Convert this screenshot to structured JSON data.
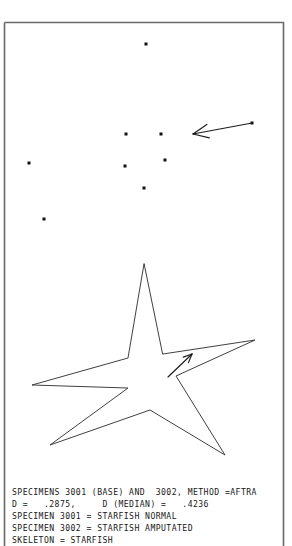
{
  "figure": {
    "background_color": "#ffffff",
    "frame_color": "#6a6a6a",
    "point_color": "#111111",
    "line_color": "#2a2a2a",
    "width": 292,
    "height": 546
  },
  "caption": {
    "line1": "SPECIMENS 3001 (BASE) AND  3002, METHOD =AFTRA",
    "line2": "D =   .2875,     D (MEDIAN) =   .4236",
    "line3": "SPECIMEN 3001 = STARFISH NORMAL",
    "line4": "SPECIMEN 3002 = STARFISH AMPUTATED",
    "line5": "SKELETON = STARFISH"
  },
  "readout": {
    "specimen_base_id": "3001",
    "specimen_target_id": "3002",
    "method": "AFTRA",
    "d_value": ".2875",
    "d_median_value": ".4236",
    "specimen_3001_label": "STARFISH NORMAL",
    "specimen_3002_label": "STARFISH AMPUTATED",
    "skeleton_label": "STARFISH"
  },
  "chart_data": {
    "type": "scatter",
    "title": "SPECIMENS 3001 (BASE) AND  3002, METHOD =AFTRA",
    "xlabel": "",
    "ylabel": "",
    "grid": false,
    "legend": "none",
    "xlim": [
      0,
      292
    ],
    "ylim": [
      546,
      0
    ],
    "series": [
      {
        "name": "landmarks",
        "marker": "square",
        "marker_size": 3,
        "points": [
          {
            "x": 146,
            "y": 44
          },
          {
            "x": 126,
            "y": 134
          },
          {
            "x": 161,
            "y": 134
          },
          {
            "x": 252,
            "y": 123
          },
          {
            "x": 29,
            "y": 163
          },
          {
            "x": 125,
            "y": 166
          },
          {
            "x": 165,
            "y": 160
          },
          {
            "x": 144,
            "y": 188
          },
          {
            "x": 44,
            "y": 219
          }
        ]
      }
    ],
    "vectors": [
      {
        "name": "displacement-arrow-outer",
        "x1": 252,
        "y1": 123,
        "x2": 193,
        "y2": 134,
        "head": "end"
      },
      {
        "name": "displacement-arrow-inner",
        "x1": 168,
        "y1": 377,
        "x2": 192,
        "y2": 354,
        "head": "end"
      }
    ],
    "skeleton": {
      "name": "STARFISH",
      "outline": [
        {
          "x": 144,
          "y": 264
        },
        {
          "x": 128,
          "y": 358
        },
        {
          "x": 32,
          "y": 385
        },
        {
          "x": 128,
          "y": 388
        },
        {
          "x": 50,
          "y": 445
        },
        {
          "x": 150,
          "y": 410
        },
        {
          "x": 225,
          "y": 455
        },
        {
          "x": 176,
          "y": 376
        },
        {
          "x": 255,
          "y": 340
        },
        {
          "x": 163,
          "y": 354
        }
      ],
      "closed": true
    }
  }
}
